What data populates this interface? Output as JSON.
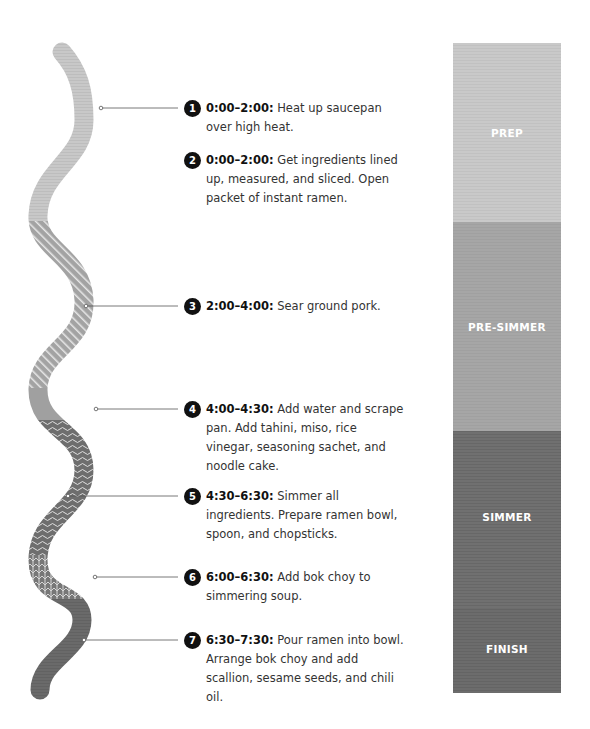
{
  "colors": {
    "prep": "#c9c9c9",
    "pre_simmer": "#a5a5a5",
    "simmer": "#6f6f6f",
    "finish": "#6b6b6b",
    "badge": "#111111",
    "text": "#333333"
  },
  "steps": [
    {
      "number": "1",
      "time": "0:00–2:00:",
      "text": "Heat up saucepan over high heat.",
      "line1": "Heat up saucepan",
      "line2": "over high heat."
    },
    {
      "number": "2",
      "time": "0:00–2:00:",
      "text": "Get ingredients lined up, measured, and sliced. Open packet of instant ramen."
    },
    {
      "number": "3",
      "time": "2:00–4:00:",
      "text": "Sear ground pork."
    },
    {
      "number": "4",
      "time": "4:00–4:30:",
      "text": "Add water and scrape pan. Add tahini, miso, rice vinegar, seasoning sachet, and noodle cake."
    },
    {
      "number": "5",
      "time": "4:30–6:30:",
      "text": "Simmer all ingredients. Prepare ramen bowl, spoon, and chopsticks."
    },
    {
      "number": "6",
      "time": "6:00–6:30:",
      "text": "Add bok choy to simmering soup."
    },
    {
      "number": "7",
      "time": "6:30–7:30:",
      "text": "Pour ramen into bowl. Arrange bok choy and add scallion, sesame seeds, and chili oil."
    }
  ],
  "phases": [
    {
      "label": "PREP",
      "start": "0:00",
      "end": "2:00"
    },
    {
      "label": "PRE-SIMMER",
      "start": "2:00",
      "end": "4:30"
    },
    {
      "label": "SIMMER",
      "start": "4:30",
      "end": "6:30"
    },
    {
      "label": "FINISH",
      "start": "6:30",
      "end": "7:30"
    }
  ]
}
